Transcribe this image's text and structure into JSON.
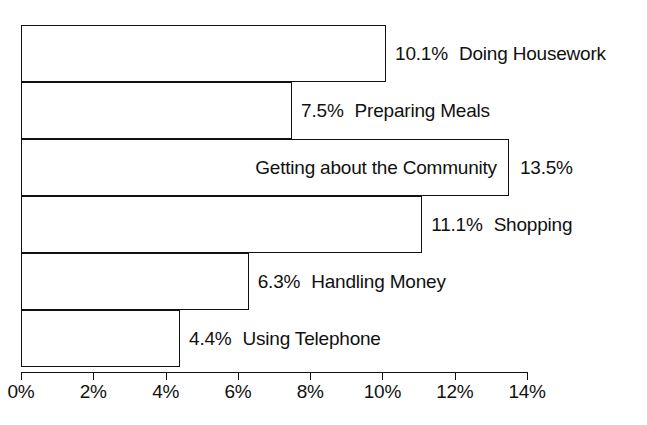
{
  "chart_data": {
    "type": "bar",
    "orientation": "horizontal",
    "title": "",
    "subtitle": "",
    "xlabel": "",
    "ylabel": "",
    "xlim": [
      0,
      14
    ],
    "grid": false,
    "legend": false,
    "value_suffix": "%",
    "categories": [
      "Doing Housework",
      "Preparing Meals",
      "Getting about the Community",
      "Shopping",
      "Handling Money",
      "Using Telephone"
    ],
    "values": [
      10.1,
      7.5,
      13.5,
      11.1,
      6.3,
      4.4
    ],
    "value_labels": [
      "10.1%",
      "7.5%",
      "13.5%",
      "11.1%",
      "6.3%",
      "4.4%"
    ],
    "xticks": [
      0,
      2,
      4,
      6,
      8,
      10,
      12,
      14
    ],
    "xtick_labels": [
      "0%",
      "2%",
      "4%",
      "6%",
      "8%",
      "10%",
      "12%",
      "14%"
    ],
    "bars": [
      {
        "category": "Doing Housework",
        "value": 10.1,
        "value_label": "10.1%",
        "label_placement": "outside",
        "label_order": "value-then-category"
      },
      {
        "category": "Preparing Meals",
        "value": 7.5,
        "value_label": "7.5%",
        "label_placement": "outside",
        "label_order": "value-then-category"
      },
      {
        "category": "Getting about the Community",
        "value": 13.5,
        "value_label": "13.5%",
        "label_placement": "category-inside-value-outside",
        "label_order": "category-then-value"
      },
      {
        "category": "Shopping",
        "value": 11.1,
        "value_label": "11.1%",
        "label_placement": "outside",
        "label_order": "value-then-category"
      },
      {
        "category": "Handling Money",
        "value": 6.3,
        "value_label": "6.3%",
        "label_placement": "outside",
        "label_order": "value-then-category"
      },
      {
        "category": "Using Telephone",
        "value": 4.4,
        "value_label": "4.4%",
        "label_placement": "outside",
        "label_order": "value-then-category"
      }
    ],
    "colors": {
      "bar_fill": "#ffffff",
      "bar_stroke": "#111111",
      "text": "#111111",
      "background": "#ffffff",
      "axis": "#111111"
    }
  }
}
